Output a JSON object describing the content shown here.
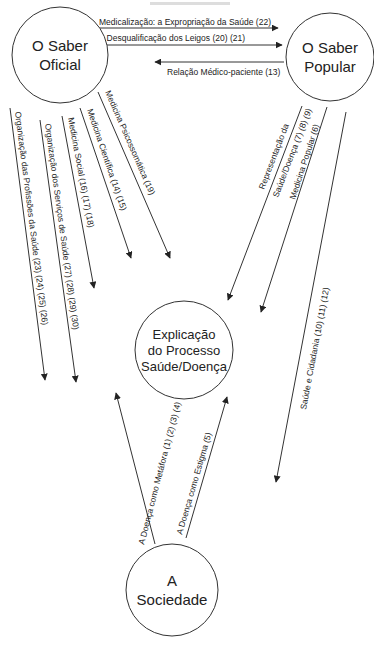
{
  "diagram": {
    "title_fragment": "",
    "nodes": {
      "saber_oficial": {
        "line1": "O Saber",
        "line2": "Oficial"
      },
      "saber_popular": {
        "line1": "O Saber",
        "line2": "Popular"
      },
      "explicacao": {
        "line1": "Explicação",
        "line2": "do Processo",
        "line3": "Saúde/Doença"
      },
      "sociedade": {
        "line1": "A",
        "line2": "Sociedade"
      }
    },
    "edges": {
      "medicalizacao": {
        "label": "Medicalização: a Expropriação da Saúde (22)",
        "from": "O Saber Oficial",
        "to": "O Saber Popular"
      },
      "desqualificacao": {
        "label": "A Desqualificação dos Leigos (20) (21)",
        "from": "O Saber Oficial",
        "to": "O Saber Popular"
      },
      "relacao_medico": {
        "label": "Relação Médico-paciente (13)",
        "from": "O Saber Popular",
        "to": "O Saber Oficial"
      },
      "org_profissoes": {
        "label": "Organização das Profissões da Saúde (23) (24) (25) (26)",
        "from": "O Saber Oficial"
      },
      "org_servicos": {
        "label": "Organização dos Serviços de Saúde (27) (28) (29) (30)",
        "from": "O Saber Oficial"
      },
      "medicina_social": {
        "label": "Medicina Social (16) (17) (18)",
        "from": "O Saber Oficial"
      },
      "medicina_cientifica": {
        "label": "Medicina Científica (14) (15)",
        "from": "O Saber Oficial"
      },
      "medicina_psicossomatica": {
        "label": "Medicina Psicossomática (19)",
        "from": "O Saber Oficial"
      },
      "representacao": {
        "label_line1": "Representação da",
        "label_line2": "Saúde/Doença (7) (8) (9)",
        "from": "O Saber Popular",
        "to": "Explicação do Processo Saúde/Doença"
      },
      "medicina_popular": {
        "label": "Medicina Popular (6)",
        "from": "O Saber Popular",
        "to": "Explicação do Processo Saúde/Doença"
      },
      "saude_cidadania": {
        "label": "Saúde e Cidadania (10) (11) (12)",
        "from": "O Saber Popular"
      },
      "metafora": {
        "label": "A Doença como Metáfora (1) (2) (3) (4)",
        "from": "A Sociedade",
        "to": "Explicação do Processo Saúde/Doença"
      },
      "estigma": {
        "label": "A Doença como Estigma (5)",
        "from": "A Sociedade",
        "to": "Explicação do Processo Saúde/Doença"
      }
    },
    "colors": {
      "stroke": "#333333",
      "text": "#222222",
      "background": "#ffffff"
    }
  }
}
